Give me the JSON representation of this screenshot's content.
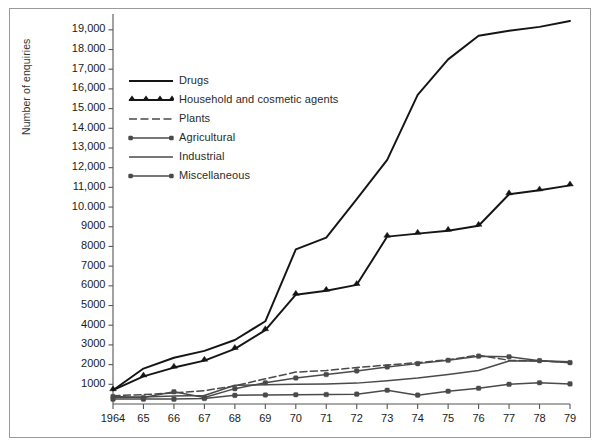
{
  "chart_data": {
    "type": "line",
    "title": "",
    "xlabel": "",
    "ylabel": "Number of enquiries",
    "grid": false,
    "legend_position": "upper-left-inside",
    "xlim": [
      1964,
      1979
    ],
    "ylim": [
      0,
      19600
    ],
    "x": [
      1964,
      1965,
      1966,
      1967,
      1968,
      1969,
      1970,
      1971,
      1972,
      1973,
      1974,
      1975,
      1976,
      1977,
      1978,
      1979
    ],
    "x_tick_labels": [
      "1964",
      "65",
      "66",
      "67",
      "68",
      "69",
      "70",
      "71",
      "72",
      "73",
      "74",
      "75",
      "76",
      "77",
      "78",
      "79"
    ],
    "y_ticks": [
      1000,
      2000,
      3000,
      4000,
      5000,
      6000,
      7000,
      8000,
      9000,
      10000,
      11000,
      12000,
      13000,
      14000,
      15000,
      16000,
      17000,
      18000,
      19000
    ],
    "y_tick_labels": [
      "1000",
      "2000",
      "3000",
      "4000",
      "5000",
      "6000",
      "7000",
      "8000",
      "9000",
      "10.000",
      "11,000",
      "12,000",
      "13,000",
      "14.000",
      "15.000",
      "16,000",
      "17,000",
      "18.000",
      "19,000"
    ],
    "series": [
      {
        "name": "Drugs",
        "marker": "none",
        "dash": "solid",
        "color": "#151515",
        "values": [
          700,
          1800,
          2350,
          2700,
          3250,
          4200,
          7850,
          8450,
          10400,
          12400,
          15700,
          17500,
          18700,
          18950,
          19150,
          19450
        ]
      },
      {
        "name": "Household and cosmetic agents",
        "marker": "triangle",
        "dash": "solid",
        "color": "#151515",
        "values": [
          700,
          1400,
          1850,
          2200,
          2800,
          3750,
          5550,
          5750,
          6050,
          8500,
          8650,
          8800,
          9050,
          10650,
          10850,
          11100
        ]
      },
      {
        "name": "Plants",
        "marker": "none",
        "dash": "dashed",
        "color": "#4a4a4a",
        "values": [
          420,
          480,
          560,
          680,
          920,
          1280,
          1620,
          1700,
          1850,
          1980,
          2100,
          2250,
          2480,
          2220,
          2180,
          2120
        ]
      },
      {
        "name": "Agricultural",
        "marker": "dot",
        "dash": "solid",
        "color": "#4a4a4a",
        "values": [
          380,
          330,
          620,
          330,
          780,
          1080,
          1320,
          1500,
          1680,
          1880,
          2050,
          2220,
          2430,
          2400,
          2200,
          2100
        ]
      },
      {
        "name": "Industrial",
        "marker": "none",
        "dash": "solid",
        "color": "#4a4a4a",
        "values": [
          330,
          360,
          400,
          430,
          950,
          980,
          1000,
          1020,
          1060,
          1180,
          1320,
          1500,
          1700,
          2180,
          2200,
          2150
        ]
      },
      {
        "name": "Miscellaneous",
        "marker": "dot",
        "dash": "solid",
        "color": "#4a4a4a",
        "values": [
          250,
          250,
          250,
          280,
          440,
          460,
          470,
          480,
          500,
          700,
          450,
          650,
          800,
          1000,
          1080,
          1020
        ]
      }
    ]
  },
  "legend": {
    "items": [
      {
        "label": "Drugs",
        "swatch": "solid-line"
      },
      {
        "label": "Household and cosmetic agents",
        "swatch": "solid-line-triangle"
      },
      {
        "label": "Plants",
        "swatch": "dashed-line"
      },
      {
        "label": "Agricultural",
        "swatch": "solid-line-dot"
      },
      {
        "label": "Industrial",
        "swatch": "solid-line"
      },
      {
        "label": "Miscellaneous",
        "swatch": "solid-line-dot"
      }
    ]
  },
  "colors": {
    "frame": "#9a9a9a",
    "axis": "#555555",
    "primary_line": "#151515",
    "secondary_line": "#4a4a4a",
    "background": "#ffffff",
    "text": "#1a1a1a"
  }
}
